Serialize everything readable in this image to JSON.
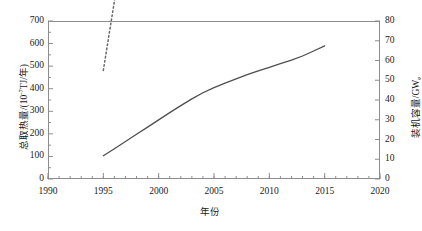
{
  "chart_data": {
    "type": "line",
    "title": "",
    "xlabel": "年份",
    "ylabel": "总取热量/(10⁻⁷TJ/年)",
    "ylabel_right": "装机容量/GWe",
    "xlim": [
      1990,
      2020
    ],
    "ylim": [
      0,
      700
    ],
    "ylim_right": [
      0,
      80
    ],
    "grid": false,
    "legend_position": "none",
    "x_ticks": [
      "1990",
      "1995",
      "2000",
      "2005",
      "2010",
      "2015",
      "2020"
    ],
    "x_tick_values": [
      1990,
      1995,
      2000,
      2005,
      2010,
      2015,
      2020
    ],
    "x_minor_tick_interval": 1,
    "y_ticks_left": [
      "0",
      "100",
      "200",
      "300",
      "400",
      "500",
      "600",
      "700"
    ],
    "y_tick_values_left": [
      0,
      100,
      200,
      300,
      400,
      500,
      600,
      700
    ],
    "y_ticks_right": [
      "0",
      "10",
      "20",
      "30",
      "40",
      "50",
      "60",
      "70",
      "80"
    ],
    "y_tick_values_right": [
      0,
      10,
      20,
      30,
      40,
      50,
      60,
      70,
      80
    ],
    "y_minor_ticks_left": 1,
    "x": [
      1995,
      1996,
      1997,
      1998,
      1999,
      2000,
      2001,
      2002,
      2003,
      2004,
      2005,
      2006,
      2007,
      2008,
      2009,
      2010,
      2011,
      2012,
      2013,
      2014,
      2015
    ],
    "series": [
      {
        "name": "总取热量",
        "axis": "left",
        "style": "solid",
        "color": "#4f4f4f",
        "values": [
          103,
          134,
          166,
          198,
          230,
          262,
          294,
          325,
          355,
          382,
          405,
          425,
          444,
          462,
          479,
          495,
          511,
          527,
          545,
          567,
          590
        ]
      },
      {
        "name": "装机容量",
        "axis": "right",
        "style": "dotted",
        "color": "#6a6a6a",
        "values": [
          55,
          90,
          125,
          160,
          196,
          232,
          268,
          303,
          337,
          370,
          400,
          423,
          444,
          464,
          483,
          501,
          520,
          540,
          563,
          592,
          625
        ]
      }
    ]
  },
  "axes": {
    "left_title": "总取热量/(10",
    "left_title_sup": "-7",
    "left_title_tail": "TJ/年)",
    "right_title": "装机容量/GW",
    "right_title_sub": "e",
    "x_title": "年份"
  }
}
